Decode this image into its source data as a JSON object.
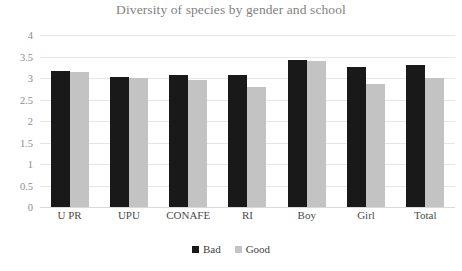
{
  "chart_data": {
    "type": "bar",
    "title": "Diversity of species by gender and school",
    "xlabel": "",
    "ylabel": "",
    "ylim": [
      0,
      4
    ],
    "ytick_labels": [
      "4",
      "3.5",
      "3",
      "2.5",
      "2",
      "1.5",
      "1",
      "0.5",
      "0"
    ],
    "ytick_values": [
      4,
      3.5,
      3,
      2.5,
      2,
      1.5,
      1,
      0.5,
      0
    ],
    "grid": true,
    "legend_position": "bottom",
    "categories": [
      "U PR",
      "UPU",
      "CONAFE",
      "RI",
      "Boy",
      "Girl",
      "Total"
    ],
    "series": [
      {
        "name": "Bad",
        "color": "#191919",
        "values": [
          3.17,
          3.03,
          3.07,
          3.08,
          3.42,
          3.25,
          3.3
        ]
      },
      {
        "name": "Good",
        "color": "#c3c3c3",
        "values": [
          3.15,
          3.0,
          2.95,
          2.8,
          3.4,
          2.85,
          3.0
        ]
      }
    ]
  },
  "colors": {
    "bad": "#191919",
    "good": "#c3c3c3",
    "title": "#7f7f7f",
    "gridline": "#e6e6e6",
    "tick_text": "#8c8c8c",
    "background": "#ffffff"
  }
}
